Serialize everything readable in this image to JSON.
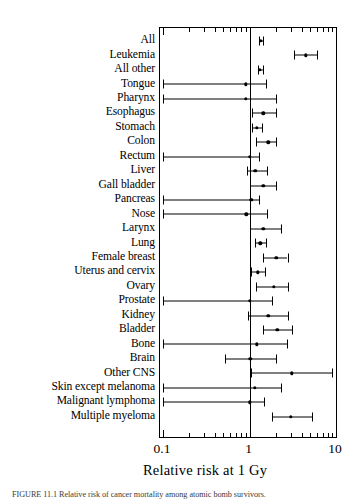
{
  "figure": {
    "axis_title": "Relative risk at 1 Gy",
    "caption": "FIGURE 11.1  Relative risk of cancer mortality among atomic bomb survivors.",
    "xtick_labels": [
      "0.1",
      "1",
      "10"
    ]
  },
  "chart_data": {
    "type": "scatter",
    "title": "",
    "xlabel": "Relative risk at 1 Gy",
    "ylabel": "",
    "xscale": "log",
    "xlim": [
      0.1,
      10
    ],
    "xticks": [
      0.1,
      1,
      10
    ],
    "xticklabels": [
      "0.1",
      "1",
      "10"
    ],
    "reference_line": 1,
    "grid": false,
    "legend": "none",
    "orientation": "horizontal-intervals",
    "categories": [
      "All",
      "Leukemia",
      "All other",
      "Tongue",
      "Pharynx",
      "Esophagus",
      "Stomach",
      "Colon",
      "Rectum",
      "Liver",
      "Gall bladder",
      "Pancreas",
      "Nose",
      "Larynx",
      "Lung",
      "Female breast",
      "Uterus and cervix",
      "Ovary",
      "Prostate",
      "Kidney",
      "Bladder",
      "Bone",
      "Brain",
      "Other CNS",
      "Skin except melanoma",
      "Malignant lymphoma",
      "Multiple myeloma"
    ],
    "points": [
      {
        "label": "All",
        "value": 1.36,
        "low": 1.29,
        "high": 1.45,
        "low_truncated": false
      },
      {
        "label": "Leukemia",
        "value": 4.5,
        "low": 3.3,
        "high": 6.1,
        "low_truncated": false
      },
      {
        "label": "All other",
        "value": 1.32,
        "low": 1.25,
        "high": 1.42,
        "low_truncated": false
      },
      {
        "label": "Tongue",
        "value": 0.9,
        "low": 0.1,
        "high": 1.55,
        "low_truncated": true
      },
      {
        "label": "Pharynx",
        "value": 0.9,
        "low": 0.1,
        "high": 2.0,
        "low_truncated": true
      },
      {
        "label": "Esophagus",
        "value": 1.45,
        "low": 1.07,
        "high": 2.0,
        "low_truncated": false
      },
      {
        "label": "Stomach",
        "value": 1.21,
        "low": 1.07,
        "high": 1.38,
        "low_truncated": false
      },
      {
        "label": "Colon",
        "value": 1.65,
        "low": 1.2,
        "high": 2.05,
        "low_truncated": false
      },
      {
        "label": "Rectum",
        "value": 1.0,
        "low": 0.1,
        "high": 1.3,
        "low_truncated": true
      },
      {
        "label": "Liver",
        "value": 1.17,
        "low": 0.94,
        "high": 1.6,
        "low_truncated": false
      },
      {
        "label": "Gall bladder",
        "value": 1.45,
        "low": 1.0,
        "high": 2.0,
        "low_truncated": false
      },
      {
        "label": "Pancreas",
        "value": 1.05,
        "low": 0.1,
        "high": 1.3,
        "low_truncated": true
      },
      {
        "label": "Nose",
        "value": 0.92,
        "low": 0.1,
        "high": 1.6,
        "low_truncated": true
      },
      {
        "label": "Larynx",
        "value": 1.45,
        "low": 1.0,
        "high": 2.3,
        "low_truncated": false
      },
      {
        "label": "Lung",
        "value": 1.34,
        "low": 1.17,
        "high": 1.55,
        "low_truncated": false
      },
      {
        "label": "Female breast",
        "value": 2.05,
        "low": 1.45,
        "high": 2.75,
        "low_truncated": false
      },
      {
        "label": "Uterus and cervix",
        "value": 1.25,
        "low": 1.05,
        "high": 1.5,
        "low_truncated": false
      },
      {
        "label": "Ovary",
        "value": 1.9,
        "low": 1.18,
        "high": 2.8,
        "low_truncated": false
      },
      {
        "label": "Prostate",
        "value": 1.0,
        "low": 0.1,
        "high": 1.8,
        "low_truncated": true
      },
      {
        "label": "Kidney",
        "value": 1.65,
        "low": 0.97,
        "high": 2.8,
        "low_truncated": false
      },
      {
        "label": "Bladder",
        "value": 2.1,
        "low": 1.45,
        "high": 3.1,
        "low_truncated": false
      },
      {
        "label": "Bone",
        "value": 1.22,
        "low": 0.1,
        "high": 2.7,
        "low_truncated": true
      },
      {
        "label": "Brain",
        "value": 1.02,
        "low": 0.52,
        "high": 2.05,
        "low_truncated": false
      },
      {
        "label": "Other CNS",
        "value": 3.1,
        "low": 1.05,
        "high": 9.0,
        "low_truncated": false
      },
      {
        "label": "Skin except melanoma",
        "value": 1.15,
        "low": 0.1,
        "high": 2.3,
        "low_truncated": true
      },
      {
        "label": "Malignant lymphoma",
        "value": 1.0,
        "low": 0.1,
        "high": 1.48,
        "low_truncated": true
      },
      {
        "label": "Multiple myeloma",
        "value": 3.0,
        "low": 1.8,
        "high": 5.3,
        "low_truncated": false
      }
    ]
  }
}
